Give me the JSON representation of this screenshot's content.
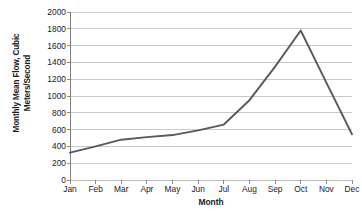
{
  "chart_data": {
    "type": "line",
    "title": "",
    "xlabel": "Month",
    "ylabel": "Monthly Mean Flow, Cubic Meters/Second",
    "categories": [
      "Jan",
      "Feb",
      "Mar",
      "Apr",
      "May",
      "Jun",
      "Jul",
      "Aug",
      "Sep",
      "Oct",
      "Nov",
      "Dec"
    ],
    "values": [
      325,
      400,
      480,
      510,
      535,
      590,
      660,
      950,
      1350,
      1780,
      1160,
      545
    ],
    "series": [
      {
        "name": "Monthly Mean Flow",
        "values": [
          325,
          400,
          480,
          510,
          535,
          590,
          660,
          950,
          1350,
          1780,
          1160,
          545
        ]
      }
    ],
    "ylim": [
      0,
      2000
    ],
    "yticks": [
      0,
      200,
      400,
      600,
      800,
      1000,
      1200,
      1400,
      1600,
      1800,
      2000
    ],
    "ytick_labels": [
      "0",
      "200",
      "400",
      "600",
      "800",
      "1000",
      "1200",
      "1400",
      "1600",
      "1800",
      "2000"
    ],
    "grid": "horizontal",
    "legend": "none",
    "markers": false,
    "line_color": "#595959",
    "grid_color": "#bfbfbf",
    "axis_color": "#808080",
    "background_color": "#ffffff"
  }
}
